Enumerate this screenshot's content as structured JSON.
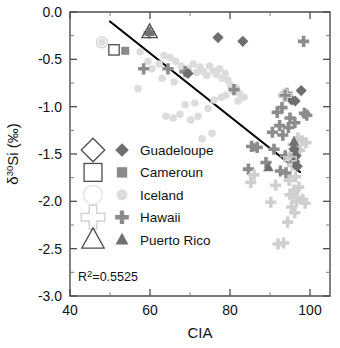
{
  "chart_data": {
    "type": "scatter",
    "title": "",
    "xlabel": "CIA",
    "ylabel": "δ30Si (‰)",
    "ylabel_parts": {
      "delta": "δ",
      "mass": "30",
      "element": "Si",
      "unit": " (‰)"
    },
    "xlim": [
      40,
      105
    ],
    "ylim": [
      -3.0,
      0.0
    ],
    "x_major_ticks": [
      40,
      60,
      80,
      100
    ],
    "x_major_ticklabels": [
      "40",
      "60",
      "80",
      "100"
    ],
    "x_minor_ticks": [
      50,
      70,
      90
    ],
    "y_major_ticks": [
      0.0,
      -0.5,
      -1.0,
      -1.5,
      -2.0,
      -2.5,
      -3.0
    ],
    "y_major_ticklabels": [
      "0.0",
      "-0.5",
      "-1.0",
      "-1.5",
      "-2.0",
      "-2.5",
      "-3.0"
    ],
    "y_minor_ticks": [
      -0.25,
      -0.75,
      -1.25,
      -1.75,
      -2.25,
      -2.75
    ],
    "grid": false,
    "legend_position": "center-left",
    "annotation": "R2=0.5525",
    "annotation_text": "R",
    "annotation_sup": "2",
    "annotation_rest": "=0.5525",
    "r_squared": 0.5525,
    "regression_line": {
      "x_start": 50.0,
      "y_start": -0.1,
      "x_end": 97.5,
      "y_end": -1.69,
      "color": "#000000"
    },
    "series": [
      {
        "name": "Guadeloupe",
        "marker": "diamond",
        "fill_color": "#6e6e6e",
        "open_color": "#4d4d4d",
        "points": [
          [
            77.0,
            -0.27
          ],
          [
            83.2,
            -0.31
          ],
          [
            69.5,
            -0.65
          ],
          [
            97.8,
            -0.83
          ],
          [
            95.4,
            -0.93
          ],
          [
            96.3,
            -0.94
          ],
          [
            96.0,
            -1.45
          ],
          [
            96.5,
            -1.52
          ],
          [
            96.2,
            -1.58
          ],
          [
            96.8,
            -1.63
          ]
        ]
      },
      {
        "name": "Cameroun",
        "marker": "square",
        "fill_color": "#8a8a8a",
        "open_color": "#4d4d4d",
        "points": [
          [
            53.8,
            -0.41
          ],
          [
            86.0,
            -1.43
          ],
          [
            96.1,
            -1.47
          ]
        ]
      },
      {
        "name": "Iceland",
        "marker": "circle",
        "fill_color": "#dcdcdc",
        "open_color": "#e2e2e2",
        "points": [
          [
            48.0,
            -0.32
          ],
          [
            57.5,
            -0.42
          ],
          [
            59.5,
            -0.52
          ],
          [
            62.3,
            -0.55
          ],
          [
            63.5,
            -0.46
          ],
          [
            65.0,
            -0.48
          ],
          [
            66.4,
            -0.52
          ],
          [
            67.8,
            -0.57
          ],
          [
            68.2,
            -0.62
          ],
          [
            69.6,
            -0.6
          ],
          [
            70.8,
            -0.55
          ],
          [
            71.6,
            -0.64
          ],
          [
            72.5,
            -0.58
          ],
          [
            73.4,
            -0.63
          ],
          [
            74.2,
            -0.67
          ],
          [
            74.9,
            -0.57
          ],
          [
            75.8,
            -0.62
          ],
          [
            76.6,
            -0.66
          ],
          [
            77.4,
            -0.6
          ],
          [
            78.0,
            -0.7
          ],
          [
            78.8,
            -0.65
          ],
          [
            79.5,
            -0.72
          ],
          [
            80.2,
            -0.78
          ],
          [
            80.9,
            -0.84
          ],
          [
            81.6,
            -0.8
          ],
          [
            82.4,
            -0.86
          ],
          [
            79.0,
            -0.88
          ],
          [
            77.8,
            -0.9
          ],
          [
            76.0,
            -0.93
          ],
          [
            74.5,
            -1.02
          ],
          [
            72.0,
            -1.1
          ],
          [
            70.2,
            -1.14
          ],
          [
            67.5,
            -1.08
          ],
          [
            65.8,
            -1.12
          ],
          [
            57.0,
            -0.81
          ],
          [
            64.0,
            -1.1
          ],
          [
            73.0,
            -1.34
          ],
          [
            75.5,
            -1.28
          ],
          [
            68.8,
            -0.98
          ],
          [
            71.2,
            -0.96
          ],
          [
            66.0,
            -0.74
          ],
          [
            63.0,
            -0.7
          ],
          [
            60.5,
            -0.6
          ],
          [
            82.0,
            -0.94
          ],
          [
            83.5,
            -0.9
          ]
        ]
      },
      {
        "name": "Hawaii",
        "marker": "plus",
        "fill_color": "#8c8c8c",
        "open_color": "#cfcfcf",
        "points": [
          [
            59.8,
            -0.22
          ],
          [
            58.4,
            -0.6
          ],
          [
            64.5,
            -0.6
          ],
          [
            68.8,
            -0.63
          ],
          [
            81.0,
            -0.82
          ],
          [
            98.4,
            -0.31
          ],
          [
            93.6,
            -0.88
          ],
          [
            94.2,
            -0.86
          ],
          [
            93.0,
            -1.01
          ],
          [
            91.8,
            -1.06
          ],
          [
            95.0,
            -1.12
          ],
          [
            98.6,
            -1.07
          ],
          [
            99.2,
            -1.09
          ],
          [
            92.4,
            -1.2
          ],
          [
            94.6,
            -1.22
          ],
          [
            96.2,
            -1.17
          ],
          [
            90.6,
            -1.27
          ],
          [
            93.2,
            -1.3
          ],
          [
            97.0,
            -1.33
          ],
          [
            98.0,
            -1.36
          ],
          [
            99.0,
            -1.38
          ],
          [
            85.4,
            -1.42
          ],
          [
            86.8,
            -1.43
          ],
          [
            91.0,
            -1.45
          ],
          [
            95.8,
            -1.4
          ],
          [
            96.6,
            -1.43
          ],
          [
            97.4,
            -1.46
          ],
          [
            93.8,
            -1.52
          ],
          [
            95.2,
            -1.55
          ],
          [
            96.0,
            -1.49
          ],
          [
            84.6,
            -1.66
          ],
          [
            86.0,
            -1.72
          ],
          [
            92.6,
            -1.68
          ],
          [
            94.0,
            -1.7
          ],
          [
            95.6,
            -1.62
          ],
          [
            85.2,
            -1.8
          ],
          [
            91.4,
            -1.83
          ],
          [
            94.8,
            -1.78
          ],
          [
            96.4,
            -1.74
          ],
          [
            90.2,
            -2.01
          ],
          [
            95.0,
            -1.93
          ],
          [
            96.8,
            -1.96
          ],
          [
            98.2,
            -1.98
          ],
          [
            98.8,
            -2.02
          ],
          [
            95.4,
            -2.06
          ],
          [
            96.2,
            -2.12
          ],
          [
            94.4,
            -2.22
          ],
          [
            96.0,
            -1.88
          ],
          [
            92.0,
            -2.45
          ],
          [
            93.4,
            -2.44
          ],
          [
            97.2,
            -1.85
          ],
          [
            89.0,
            -1.59
          ],
          [
            96.6,
            -2.0
          ]
        ]
      },
      {
        "name": "Puerto Rico",
        "marker": "triangle",
        "fill_color": "#707070",
        "open_color": "#4d4d4d",
        "points": [
          [
            59.9,
            -0.21
          ],
          [
            96.0,
            -1.37
          ],
          [
            89.6,
            -1.64
          ]
        ]
      }
    ]
  },
  "legend": {
    "entries": [
      {
        "label": "Guadeloupe",
        "marker": "diamond"
      },
      {
        "label": "Cameroun",
        "marker": "square"
      },
      {
        "label": "Iceland",
        "marker": "circle"
      },
      {
        "label": "Hawaii",
        "marker": "plus"
      },
      {
        "label": "Puerto Rico",
        "marker": "triangle"
      }
    ]
  }
}
